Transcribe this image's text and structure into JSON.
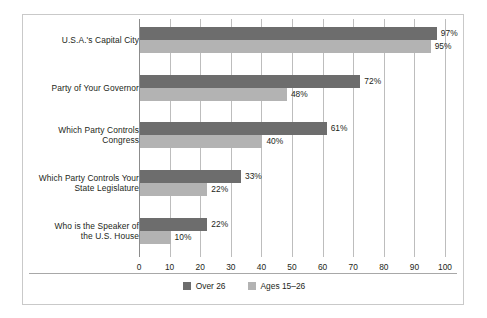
{
  "chart_data": {
    "type": "bar",
    "orientation": "horizontal",
    "title": "",
    "subtitle": "",
    "xlabel": "",
    "ylabel": "",
    "xlim": [
      0,
      100
    ],
    "xticks": [
      "0",
      "10",
      "20",
      "30",
      "40",
      "50",
      "60",
      "70",
      "80",
      "90",
      "100"
    ],
    "grid": true,
    "legend_position": "bottom-center",
    "categories": [
      "U.S.A.'s Capital City",
      "Party of Your Governor",
      "Which Party Controls Congress",
      "Which Party Controls Your State Legislature",
      "Who is the Speaker of the U.S. House"
    ],
    "category_lines": [
      [
        "U.S.A.'s Capital City"
      ],
      [
        "Party of Your Governor"
      ],
      [
        "Which Party Controls",
        "Congress"
      ],
      [
        "Which Party Controls Your",
        "State Legislature"
      ],
      [
        "Who is the Speaker of",
        "the U.S. House"
      ]
    ],
    "series": [
      {
        "name": "Over 26",
        "color": "#6d6d6d",
        "values": [
          97,
          72,
          61,
          33,
          22
        ],
        "value_labels": [
          "97%",
          "72%",
          "61%",
          "33%",
          "22%"
        ]
      },
      {
        "name": "Ages 15-26",
        "color": "#b3b3b3",
        "values": [
          95,
          48,
          40,
          22,
          10
        ],
        "value_labels": [
          "95%",
          "48%",
          "40%",
          "22%",
          "10%"
        ]
      }
    ]
  },
  "legend": {
    "items": [
      {
        "label": "Over 26",
        "color": "#6d6d6d"
      },
      {
        "label": "Ages 15–26",
        "color": "#b3b3b3"
      }
    ]
  },
  "colors": {
    "series_dark": "#6d6d6d",
    "series_light": "#b3b3b3",
    "gridline": "#bdbdbd",
    "axis": "#8c8c8c",
    "border": "#c9c9c9",
    "text": "#231f20",
    "background": "#ffffff"
  }
}
